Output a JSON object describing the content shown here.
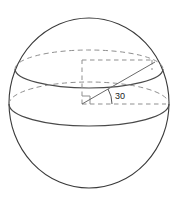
{
  "figure": {
    "canvas": {
      "width": 179,
      "height": 201,
      "background": "#ffffff"
    },
    "labels": {
      "angle_value": "30"
    },
    "colors": {
      "outline": "#3a3a3a",
      "solid_section": "#4a4a4a",
      "dashed_section": "#8a8a8a",
      "construction": "#8a8a8a",
      "radius_line": "#6a6a6a",
      "text": "#1a1a1a"
    },
    "geometry": {
      "sphere": {
        "cx": 89,
        "cy": 103,
        "rx": 80,
        "ry": 85
      },
      "upper_circle": {
        "cx": 89,
        "cy": 69,
        "rx": 74,
        "ry": 19
      },
      "equator_circle": {
        "cx": 89,
        "cy": 104,
        "rx": 80,
        "ry": 22
      },
      "center_point": {
        "x": 82,
        "y": 103
      },
      "radius_endpoint": {
        "x": 152,
        "y": 62
      },
      "rect_top_y": 60,
      "rect_right_x": 152,
      "angle_degrees": 30,
      "angle_arc_radius": 26,
      "angle_label_pos": {
        "x": 114,
        "y": 97
      }
    }
  }
}
